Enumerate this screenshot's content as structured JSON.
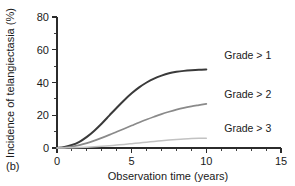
{
  "panel": {
    "label": "(b)"
  },
  "chart_data": {
    "type": "line",
    "title": "",
    "xlabel": "Observation time (years)",
    "ylabel": "Incidence of telangiectasia (%)",
    "xlim": [
      0,
      15
    ],
    "ylim": [
      0,
      80
    ],
    "xticks": [
      0,
      5,
      10,
      15
    ],
    "xticklabels": [
      "0",
      "5",
      "10",
      "15"
    ],
    "xminor_step": 1,
    "yticks": [
      0,
      20,
      40,
      60,
      80
    ],
    "yticklabels": [
      "0",
      "20",
      "40",
      "60",
      "80"
    ],
    "yminor_step": 10,
    "grid": false,
    "legend_position": "inline-right",
    "x": [
      0,
      0.5,
      1,
      1.5,
      2,
      2.5,
      3,
      3.5,
      4,
      4.5,
      5,
      5.5,
      6,
      6.5,
      7,
      7.5,
      8,
      8.5,
      9,
      9.5,
      10
    ],
    "series": [
      {
        "name": "Grade > 1",
        "color": "#3a3a3a",
        "linewidth": 2.0,
        "label_x": 11.2,
        "label_y": 57,
        "values": [
          0,
          0.6,
          1.8,
          3.8,
          6.8,
          10.6,
          15.0,
          19.8,
          24.6,
          29.2,
          33.4,
          37.0,
          40.0,
          42.4,
          44.2,
          45.6,
          46.5,
          47.1,
          47.5,
          47.8,
          48.0
        ]
      },
      {
        "name": "Grade > 2",
        "color": "#8a8a8a",
        "linewidth": 1.7,
        "label_x": 11.2,
        "label_y": 33,
        "values": [
          0,
          0.3,
          0.9,
          1.8,
          3.0,
          4.5,
          6.2,
          8.0,
          9.9,
          11.8,
          13.7,
          15.6,
          17.4,
          19.1,
          20.7,
          22.1,
          23.4,
          24.5,
          25.4,
          26.2,
          27.0
        ]
      },
      {
        "name": "Grade > 3",
        "color": "#c2c2c2",
        "linewidth": 1.5,
        "label_x": 11.2,
        "label_y": 12,
        "values": [
          0,
          0.05,
          0.15,
          0.3,
          0.5,
          0.75,
          1.05,
          1.4,
          1.8,
          2.2,
          2.65,
          3.1,
          3.55,
          4.0,
          4.45,
          4.85,
          5.2,
          5.5,
          5.75,
          5.9,
          6.0
        ]
      }
    ]
  }
}
